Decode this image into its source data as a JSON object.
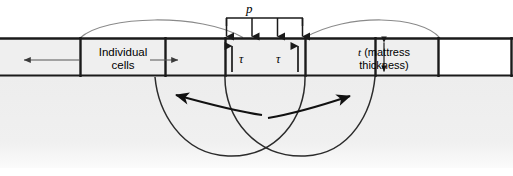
{
  "figure": {
    "background_color": "#ffffff",
    "soil_fill_color": "#efefef",
    "line_color": "#1a1a1a",
    "heave_curve_color": "#888888",
    "width": 513,
    "height": 176
  },
  "labels": {
    "pressure": "p",
    "shear_left": "τ",
    "shear_right": "τ",
    "individual_cells": "Individual cells",
    "thickness_symbol": "t",
    "thickness_note": "(mattress thickness)"
  },
  "annotations": {
    "pressure_arrow_count": 4,
    "shear_arrow_direction": "up",
    "pressure_arrow_direction": "down",
    "cells_leader_left_direction": "left",
    "cells_leader_right_direction": "right",
    "thickness_arrow_direction": "double-vertical",
    "slip_arrow_left_direction": "up-left",
    "slip_arrow_right_direction": "up-right"
  },
  "geometry": {
    "mattress_top_y": 38,
    "mattress_bottom_y": 76,
    "cell_dividers_x": [
      80,
      165,
      225,
      305,
      375,
      438
    ],
    "loaded_cell_left_x": 225,
    "loaded_cell_right_x": 305
  }
}
